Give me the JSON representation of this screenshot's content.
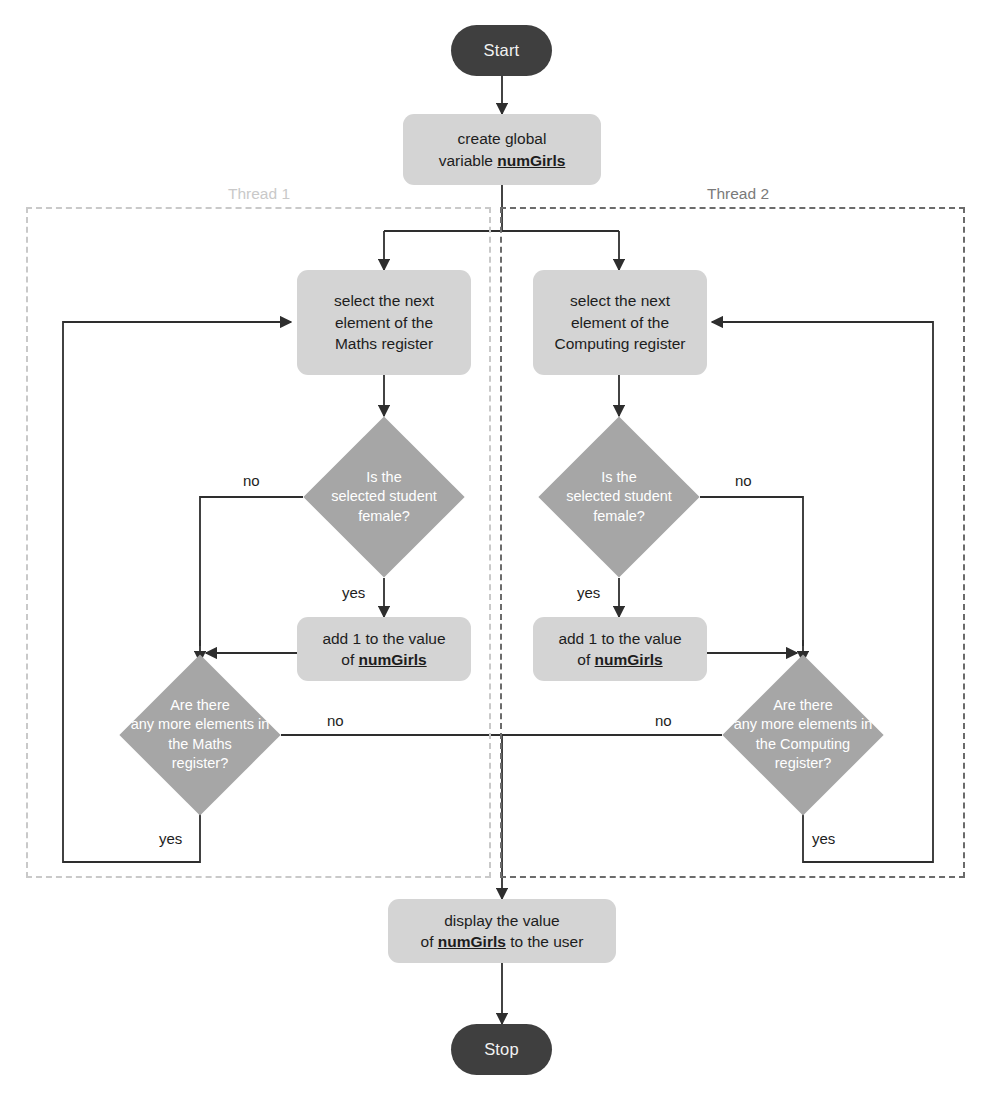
{
  "diagram": {
    "variable_name": "numGirls",
    "colors": {
      "terminator_fill": "#3f3f3f",
      "terminator_text": "#f2f2f2",
      "process_fill": "#d4d4d4",
      "process_text": "#1d1d1d",
      "decision_fill": "#a6a6a6",
      "decision_text": "#ffffff",
      "edge_stroke": "#2e2e2e",
      "thread1_dash": "#c9c9c9",
      "thread2_dash": "#6b6b6b",
      "background": "#ffffff"
    }
  },
  "lanes": [
    {
      "id": "thread-1",
      "label": "Thread 1"
    },
    {
      "id": "thread-2",
      "label": "Thread 2"
    }
  ],
  "nodes": {
    "start": {
      "type": "terminator",
      "label": "Start"
    },
    "create_global": {
      "type": "process",
      "line1": "create global",
      "line2_prefix": "variable ",
      "line2_var": "numGirls"
    },
    "select_maths": {
      "type": "process",
      "line1": "select the next",
      "line2": "element of the",
      "line3": "Maths register"
    },
    "select_computing": {
      "type": "process",
      "line1": "select the next",
      "line2": "element of the",
      "line3": "Computing register"
    },
    "is_female_left": {
      "type": "decision",
      "line1": "Is the",
      "line2": "selected student",
      "line3": "female?"
    },
    "is_female_right": {
      "type": "decision",
      "line1": "Is the",
      "line2": "selected student",
      "line3": "female?"
    },
    "add_one_left": {
      "type": "process",
      "line1": "add 1 to the value",
      "line2_prefix": "of ",
      "line2_var": "numGirls"
    },
    "add_one_right": {
      "type": "process",
      "line1": "add 1 to the value",
      "line2_prefix": "of ",
      "line2_var": "numGirls"
    },
    "more_maths": {
      "type": "decision",
      "line1": "Are there",
      "line2": "any more elements in",
      "line3": "the Maths",
      "line4": "register?"
    },
    "more_computing": {
      "type": "decision",
      "line1": "Are there",
      "line2": "any more elements in",
      "line3": "the Computing",
      "line4": "register?"
    },
    "display": {
      "type": "process",
      "line1": "display the value",
      "line2_prefix": "of ",
      "line2_var": "numGirls",
      "line2_suffix": " to the user"
    },
    "stop": {
      "type": "terminator",
      "label": "Stop"
    }
  },
  "edge_labels": {
    "female_left_no": "no",
    "female_left_yes": "yes",
    "female_right_no": "no",
    "female_right_yes": "yes",
    "more_maths_no": "no",
    "more_maths_yes": "yes",
    "more_computing_no": "no",
    "more_computing_yes": "yes"
  }
}
